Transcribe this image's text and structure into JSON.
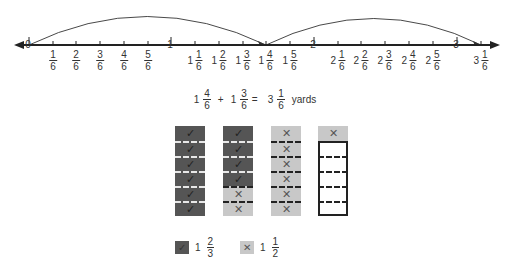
{
  "number_line": {
    "ticks": [
      {
        "whole": "0",
        "num": "",
        "den": "",
        "x": 29
      },
      {
        "whole": "",
        "num": "1",
        "den": "6",
        "x": 53
      },
      {
        "whole": "",
        "num": "2",
        "den": "6",
        "x": 76
      },
      {
        "whole": "",
        "num": "3",
        "den": "6",
        "x": 100
      },
      {
        "whole": "",
        "num": "4",
        "den": "6",
        "x": 124
      },
      {
        "whole": "",
        "num": "5",
        "den": "6",
        "x": 148
      },
      {
        "whole": "1",
        "num": "",
        "den": "",
        "x": 171
      },
      {
        "whole": "1",
        "num": "1",
        "den": "6",
        "x": 195
      },
      {
        "whole": "1",
        "num": "2",
        "den": "6",
        "x": 219
      },
      {
        "whole": "1",
        "num": "3",
        "den": "6",
        "x": 243
      },
      {
        "whole": "1",
        "num": "4",
        "den": "6",
        "x": 266
      },
      {
        "whole": "1",
        "num": "5",
        "den": "6",
        "x": 290
      },
      {
        "whole": "2",
        "num": "",
        "den": "",
        "x": 314
      },
      {
        "whole": "2",
        "num": "1",
        "den": "6",
        "x": 338
      },
      {
        "whole": "2",
        "num": "2",
        "den": "6",
        "x": 361
      },
      {
        "whole": "2",
        "num": "3",
        "den": "6",
        "x": 385
      },
      {
        "whole": "2",
        "num": "4",
        "den": "6",
        "x": 409
      },
      {
        "whole": "2",
        "num": "5",
        "den": "6",
        "x": 433
      },
      {
        "whole": "3",
        "num": "",
        "den": "",
        "x": 457
      },
      {
        "whole": "3",
        "num": "1",
        "den": "6",
        "x": 481
      }
    ],
    "jumps": [
      {
        "from": "0",
        "to": "1 4/6"
      },
      {
        "from": "1 4/6",
        "to": "3 1/6"
      }
    ]
  },
  "equation": {
    "a_whole": "1",
    "a_num": "4",
    "a_den": "6",
    "plus": "+",
    "b_whole": "1",
    "b_num": "3",
    "b_den": "6",
    "equals": "=",
    "r_whole": "3",
    "r_num": "1",
    "r_den": "6",
    "unit": "yards"
  },
  "bars": [
    {
      "cells": [
        "check",
        "check",
        "check",
        "check",
        "check",
        "check"
      ],
      "shade": [
        "dark",
        "dark",
        "dark",
        "dark",
        "dark",
        "dark"
      ]
    },
    {
      "cells": [
        "check",
        "check",
        "check",
        "check",
        "cross",
        "cross"
      ],
      "shade": [
        "dark",
        "dark",
        "dark",
        "dark",
        "light",
        "light"
      ]
    },
    {
      "cells": [
        "cross",
        "cross",
        "cross",
        "cross",
        "cross",
        "cross"
      ],
      "shade": [
        "light",
        "light",
        "light",
        "light",
        "light",
        "light"
      ]
    },
    {
      "cells": [
        "cross",
        "",
        "",
        "",
        "",
        ""
      ],
      "shade": [
        "light",
        "empty",
        "empty",
        "empty",
        "empty",
        "empty"
      ]
    }
  ],
  "legend": [
    {
      "symbol": "✓",
      "whole": "1",
      "num": "2",
      "den": "3",
      "color": "#555555"
    },
    {
      "symbol": "✕",
      "whole": "1",
      "num": "1",
      "den": "2",
      "color": "#c8c8c8"
    }
  ],
  "symbols": {
    "check": "✓",
    "cross": "✕"
  }
}
